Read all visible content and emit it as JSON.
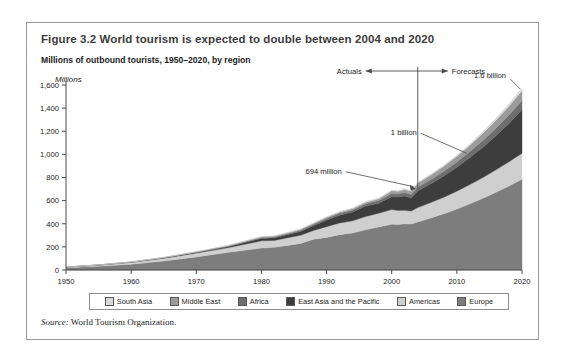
{
  "figure": {
    "title": "Figure 3.2  World tourism is expected to double between 2004 and 2020",
    "subtitle": "Millions of outbound tourists, 1950–2020, by region",
    "source_label": "Source:",
    "source_text": " World Tourism Organization."
  },
  "annotations": {
    "actuals": "Actuals",
    "forecasts": "Forecasts",
    "peak": "1.6 billion",
    "billion": "1 billion",
    "current": "694 million"
  },
  "chart_data": {
    "type": "area",
    "title": "Millions of outbound tourists, 1950–2020, by region",
    "xlabel": "",
    "ylabel": "Millions",
    "ylim": [
      0,
      1600
    ],
    "xlim": [
      1950,
      2020
    ],
    "ytick_labels": [
      "0",
      "200",
      "400",
      "600",
      "800",
      "1,000",
      "1,200",
      "1,400",
      "1,600"
    ],
    "yticks": [
      0,
      200,
      400,
      600,
      800,
      1000,
      1200,
      1400,
      1600
    ],
    "xticks": [
      1950,
      1960,
      1970,
      1980,
      1990,
      2000,
      2010,
      2020
    ],
    "xtick_labels": [
      "1950",
      "1960",
      "1970",
      "1980",
      "1990",
      "2000",
      "2010",
      "2020"
    ],
    "grid": false,
    "legend_position": "bottom",
    "stack_order_bottom_to_top": [
      "Europe",
      "Americas",
      "East Asia and the Pacific",
      "Africa",
      "Middle East",
      "South Asia"
    ],
    "divider_year": 2004,
    "divider_label_left": "Actuals",
    "divider_label_right": "Forecasts",
    "x": [
      1950,
      1955,
      1960,
      1965,
      1970,
      1975,
      1980,
      1982,
      1984,
      1986,
      1988,
      1990,
      1992,
      1994,
      1996,
      1998,
      2000,
      2001,
      2002,
      2003,
      2004,
      2006,
      2008,
      2010,
      2012,
      2014,
      2016,
      2018,
      2020
    ],
    "series": [
      {
        "name": "Europe",
        "color": "#7d7d7d",
        "values": [
          19,
          33,
          50,
          78,
          113,
          153,
          190,
          196,
          212,
          230,
          265,
          282,
          305,
          320,
          348,
          372,
          395,
          393,
          399,
          397,
          416,
          450,
          486,
          527,
          572,
          620,
          672,
          727,
          785
        ]
      },
      {
        "name": "Americas",
        "color": "#cfcfcf",
        "values": [
          6,
          9,
          16,
          23,
          33,
          41,
          62,
          60,
          66,
          70,
          77,
          93,
          102,
          105,
          115,
          119,
          128,
          122,
          117,
          113,
          124,
          133,
          143,
          155,
          167,
          180,
          194,
          209,
          225
        ]
      },
      {
        "name": "East Asia and the Pacific",
        "color": "#3d3d3d",
        "values": [
          0,
          1,
          2,
          4,
          6,
          10,
          21,
          22,
          27,
          33,
          41,
          56,
          66,
          76,
          90,
          87,
          111,
          116,
          125,
          113,
          144,
          163,
          184,
          207,
          233,
          262,
          295,
          332,
          375
        ]
      },
      {
        "name": "Africa",
        "color": "#6e6e6e",
        "values": [
          1,
          1,
          1,
          2,
          3,
          5,
          7,
          8,
          9,
          10,
          12,
          15,
          17,
          18,
          20,
          23,
          27,
          28,
          29,
          30,
          33,
          37,
          41,
          46,
          52,
          58,
          65,
          72,
          80
        ]
      },
      {
        "name": "Middle East",
        "color": "#9b9b9b",
        "values": [
          0,
          0,
          1,
          1,
          2,
          3,
          7,
          7,
          8,
          9,
          10,
          10,
          11,
          12,
          14,
          16,
          24,
          23,
          27,
          29,
          35,
          39,
          44,
          49,
          55,
          62,
          69,
          77,
          85
        ]
      },
      {
        "name": "South Asia",
        "color": "#d9d9d9",
        "values": [
          0,
          0,
          0,
          1,
          1,
          2,
          2,
          2,
          3,
          3,
          4,
          4,
          5,
          5,
          6,
          6,
          6,
          6,
          6,
          6,
          7,
          8,
          9,
          11,
          13,
          15,
          18,
          21,
          24
        ]
      }
    ]
  },
  "legend": {
    "items": [
      {
        "label": "South Asia",
        "color": "#d9d9d9"
      },
      {
        "label": "Middle East",
        "color": "#9b9b9b"
      },
      {
        "label": "Africa",
        "color": "#6e6e6e"
      },
      {
        "label": "East Asia and the Pacific",
        "color": "#3d3d3d"
      },
      {
        "label": "Americas",
        "color": "#cfcfcf"
      },
      {
        "label": "Europe",
        "color": "#7d7d7d"
      }
    ]
  }
}
